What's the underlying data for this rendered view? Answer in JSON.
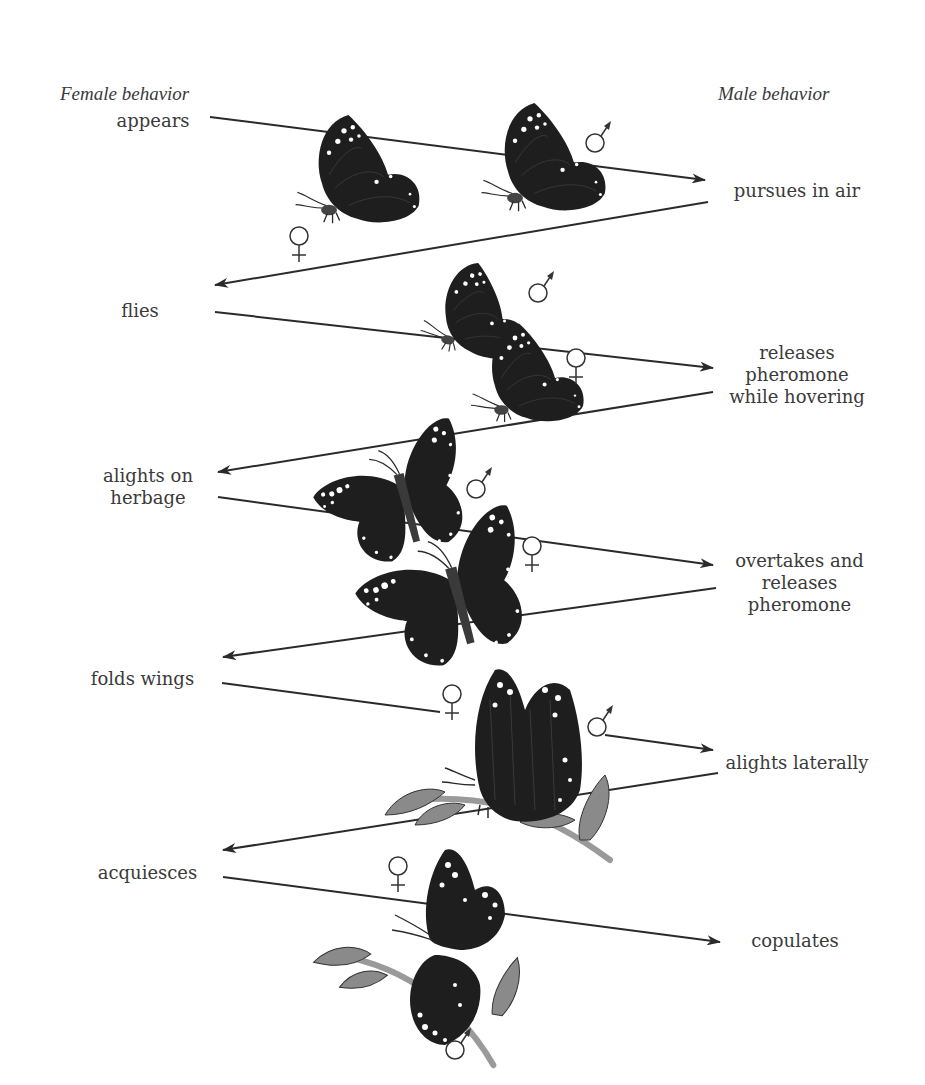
{
  "diagram": {
    "headers": {
      "female": "Female behavior",
      "male": "Male behavior"
    },
    "female_steps": [
      {
        "label": "appears"
      },
      {
        "label": "flies"
      },
      {
        "label": "alights on herbage"
      },
      {
        "label": "folds wings"
      },
      {
        "label": "acquiesces"
      }
    ],
    "male_steps": [
      {
        "label": "pursues in air"
      },
      {
        "label": "releases pheromone while hovering"
      },
      {
        "label": "overtakes and releases pheromone"
      },
      {
        "label": "alights laterally"
      },
      {
        "label": "copulates"
      }
    ],
    "symbols": {
      "female": "♀",
      "male": "♂"
    },
    "sequence": [
      "appears",
      "pursues in air",
      "flies",
      "releases pheromone while hovering",
      "alights on herbage",
      "overtakes and releases pheromone",
      "folds wings",
      "alights laterally",
      "acquiesces",
      "copulates"
    ],
    "colors": {
      "butterfly": "#1e1e1e",
      "spots": "#ffffff",
      "leaf": "#8a8a8a",
      "stem": "#9a9a9a",
      "line": "#2a2a2a",
      "text": "#3a3a3a"
    }
  }
}
